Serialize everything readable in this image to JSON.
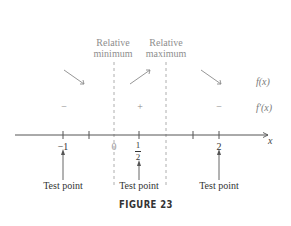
{
  "figure": {
    "caption": "FIGURE 23",
    "header": {
      "left": "Relative minimum",
      "left_line1": "Relative",
      "left_line2": "minimum",
      "right": "Relative maximum",
      "right_line1": "Relative",
      "right_line2": "maximum"
    },
    "rows": {
      "f_label": "f(x)",
      "fprime_label": "f′(x)"
    },
    "intervals": [
      {
        "f_direction": "decreasing",
        "fprime_sign": "−"
      },
      {
        "f_direction": "increasing",
        "fprime_sign": "+"
      },
      {
        "f_direction": "decreasing",
        "fprime_sign": "−"
      }
    ],
    "axis": {
      "variable": "x",
      "labels": {
        "neg_one": "−1",
        "zero": "0",
        "half_num": "1",
        "half_den": "2",
        "two": "2"
      }
    },
    "test_points": [
      {
        "value": "−1",
        "label": "Test point"
      },
      {
        "value": "1/2",
        "label": "Test point"
      },
      {
        "value": "2",
        "label": "Test point"
      }
    ],
    "critical_points": [
      {
        "x": "0",
        "type": "Relative minimum"
      },
      {
        "x": "1",
        "type": "Relative maximum"
      }
    ]
  },
  "colors": {
    "axis": "#555555",
    "dashed": "#9a9a9a",
    "arrows": "#8a8a8a",
    "text": "#333333",
    "header_text": "#8e8e8e"
  }
}
